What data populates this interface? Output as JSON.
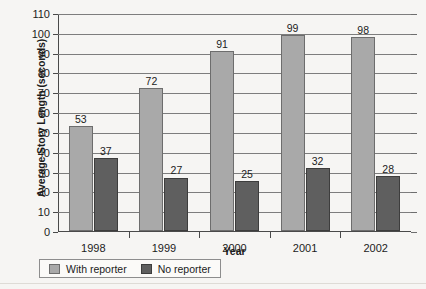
{
  "chart_data": {
    "type": "bar",
    "title": "",
    "xlabel": "Year",
    "ylabel": "Average Story Length (seconds)",
    "categories": [
      "1998",
      "1999",
      "2000",
      "2001",
      "2002"
    ],
    "series": [
      {
        "name": "With reporter",
        "color": "#a9a9a9",
        "values": [
          53,
          72,
          91,
          99,
          98
        ]
      },
      {
        "name": "No reporter",
        "color": "#5f5f5f",
        "values": [
          37,
          27,
          25,
          32,
          28
        ]
      }
    ],
    "ylim": [
      0,
      110
    ],
    "ytick_step": 10,
    "yticks": [
      0,
      10,
      20,
      30,
      40,
      50,
      60,
      70,
      80,
      90,
      100,
      110
    ],
    "grid": true,
    "data_labels": true,
    "legend_position": "bottom"
  },
  "legend": {
    "items": [
      {
        "label": "With reporter"
      },
      {
        "label": "No reporter"
      }
    ]
  }
}
